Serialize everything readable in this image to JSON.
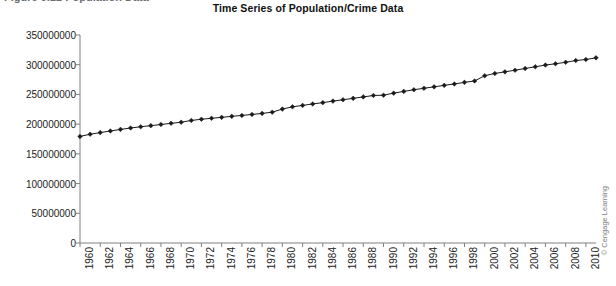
{
  "caption": {
    "text": "Figure 9.12   Population Data"
  },
  "watermark": {
    "text": "© Cengage Learning"
  },
  "chart_data": {
    "type": "line",
    "title": "Time Series of Population/Crime Data",
    "xlabel": "",
    "ylabel": "",
    "grid": false,
    "legend": "none",
    "marker": "diamond",
    "line_color": "#1a1a1a",
    "marker_color": "#1a1a1a",
    "axis_color": "#808080",
    "ylim": [
      0,
      350000000
    ],
    "ytick_labels": [
      "350000000",
      "300000000",
      "250000000",
      "200000000",
      "150000000",
      "100000000",
      "50000000",
      "0"
    ],
    "yticks": [
      350000000,
      300000000,
      250000000,
      200000000,
      150000000,
      100000000,
      50000000,
      0
    ],
    "xlim": [
      1960,
      2011
    ],
    "xtick_labels": [
      "1960",
      "1962",
      "1964",
      "1966",
      "1968",
      "1970",
      "1972",
      "1974",
      "1976",
      "1978",
      "1980",
      "1982",
      "1984",
      "1986",
      "1988",
      "1990",
      "1992",
      "1994",
      "1996",
      "1998",
      "2000",
      "2002",
      "2004",
      "2006",
      "2008",
      "2010"
    ],
    "xticks": [
      1960,
      1962,
      1964,
      1966,
      1968,
      1970,
      1972,
      1974,
      1976,
      1978,
      1980,
      1982,
      1984,
      1986,
      1988,
      1990,
      1992,
      1994,
      1996,
      1998,
      2000,
      2002,
      2004,
      2006,
      2008,
      2010
    ],
    "x": [
      1960,
      1961,
      1962,
      1963,
      1964,
      1965,
      1966,
      1967,
      1968,
      1969,
      1970,
      1971,
      1972,
      1973,
      1974,
      1975,
      1976,
      1977,
      1978,
      1979,
      1980,
      1981,
      1982,
      1983,
      1984,
      1985,
      1986,
      1987,
      1988,
      1989,
      1990,
      1991,
      1992,
      1993,
      1994,
      1995,
      1996,
      1997,
      1998,
      1999,
      2000,
      2001,
      2002,
      2003,
      2004,
      2005,
      2006,
      2007,
      2008,
      2009,
      2010,
      2011
    ],
    "values": [
      179323000,
      182992000,
      185771000,
      188483000,
      191141000,
      193526000,
      195576000,
      197457000,
      199399000,
      201385000,
      203235000,
      206212000,
      208230000,
      209851000,
      211392000,
      213124000,
      214659000,
      216332000,
      218059000,
      220099000,
      225349000,
      229146000,
      231534000,
      233981000,
      236158000,
      238740000,
      241077000,
      243400000,
      245807000,
      248239000,
      248709873,
      252177000,
      255082000,
      257908000,
      260341000,
      262755000,
      265284000,
      267637000,
      270296000,
      272691000,
      281421906,
      285318000,
      287973924,
      290788976,
      293656842,
      296507061,
      299398484,
      301621157,
      304059724,
      307006550,
      308745538,
      311591917
    ]
  }
}
